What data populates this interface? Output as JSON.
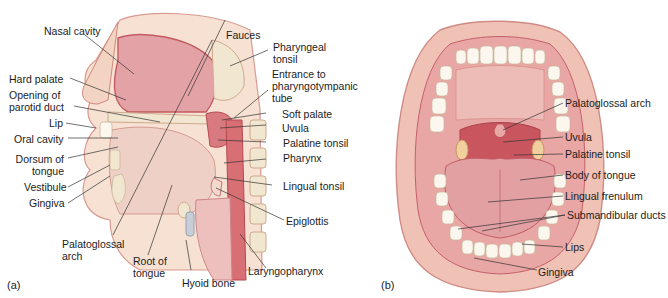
{
  "figure": {
    "panel_a": {
      "tag": "(a)",
      "view": "sagittal section of head",
      "labels": {
        "nasal_cavity": "Nasal cavity",
        "hard_palate": "Hard palate",
        "opening_parotid_1": "Opening of",
        "opening_parotid_2": "parotid duct",
        "lip": "Lip",
        "oral_cavity": "Oral cavity",
        "dorsum_1": "Dorsum of",
        "dorsum_2": "tongue",
        "vestibule": "Vestibule",
        "gingiva": "Gingiva",
        "palatoglossal_1": "Palatoglossal",
        "palatoglossal_2": "arch",
        "root_1": "Root of",
        "root_2": "tongue",
        "hyoid_bone": "Hyoid bone",
        "fauces": "Fauces",
        "pharyngeal_1": "Pharyngeal",
        "pharyngeal_2": "tonsil",
        "entrance_1": "Entrance to",
        "entrance_2": "pharyngotympanic",
        "entrance_3": "tube",
        "soft_palate": "Soft palate",
        "uvula": "Uvula",
        "palatine_tonsil": "Palatine tonsil",
        "pharynx": "Pharynx",
        "lingual_tonsil": "Lingual tonsil",
        "epiglottis": "Epiglottis",
        "laryngopharynx": "Laryngopharynx"
      }
    },
    "panel_b": {
      "tag": "(b)",
      "view": "anterior view of open mouth",
      "labels": {
        "palatoglossal_arch": "Palatoglossal arch",
        "uvula": "Uvula",
        "palatine_tonsil": "Palatine tonsil",
        "body_of_tongue": "Body of tongue",
        "lingual_frenulum": "Lingual frenulum",
        "submandibular_ducts": "Submandibular ducts",
        "lips": "Lips",
        "gingiva": "Gingiva"
      }
    },
    "colors": {
      "tissue_light": "#f4d9c8",
      "tissue_pink": "#e9a9a4",
      "tissue_dark": "#c9545a",
      "bone": "#f1e6cf",
      "tooth": "#fbf7ee",
      "leader_line": "#333333"
    }
  }
}
